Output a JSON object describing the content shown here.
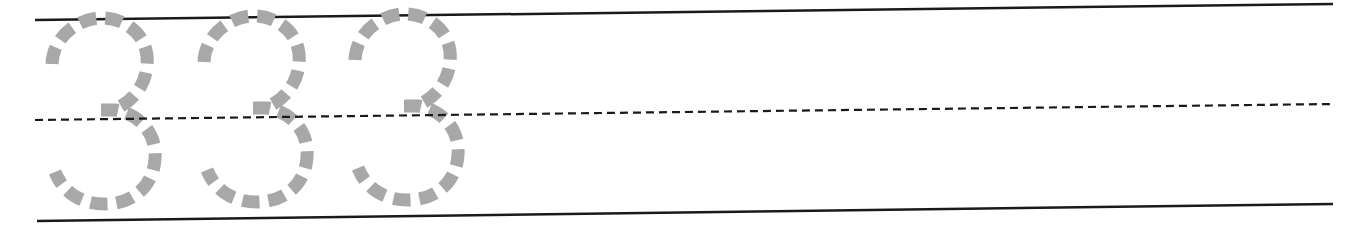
{
  "worksheet": {
    "type": "number tracing practice",
    "digit": "3",
    "trace_count": 3,
    "colors": {
      "background": "#ffffff",
      "guide_line": "#1a1a1a",
      "trace_dash": "#a8a8a8"
    },
    "lines": {
      "top": {
        "x1": 35,
        "y1": 20,
        "x2": 1333,
        "y2": 4,
        "style": "solid"
      },
      "middle": {
        "x1": 35,
        "y1": 120,
        "x2": 1333,
        "y2": 104,
        "style": "dashed"
      },
      "bottom": {
        "x1": 37,
        "y1": 221,
        "x2": 1333,
        "y2": 204,
        "style": "solid"
      }
    },
    "digits": [
      {
        "label": "3",
        "x": 40,
        "y": 17
      },
      {
        "label": "3",
        "x": 192,
        "y": 15
      },
      {
        "label": "3",
        "x": 343,
        "y": 13
      }
    ]
  }
}
